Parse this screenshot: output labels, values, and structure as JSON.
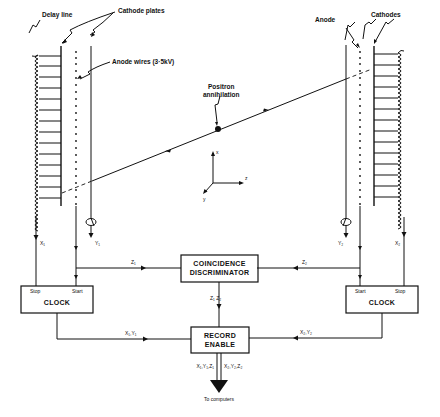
{
  "diagram": {
    "labels": {
      "delay_line": "Delay line",
      "cathode_plates": "Cathode plates",
      "anode_wires": "Anode wires (3·5kV)",
      "anode": "Anode",
      "cathodes": "Cathodes",
      "positron_line1": "Positron",
      "positron_line2": "annihilation",
      "axis_x": "x",
      "axis_y": "y",
      "axis_z": "z"
    },
    "signals": {
      "x1": "X₁",
      "y1": "Y₁",
      "x2": "X₂",
      "y2": "Y₂",
      "z1": "Z₁",
      "z2": "Z₂",
      "z1z2": "Z₁ Z₂",
      "x1y1": "X₁,Y₁",
      "x2y2": "X₂,Y₂",
      "x1y1z1": "X₁,Y₁,Z₁",
      "x2y2z2": "X₂,Y₂,Z₂"
    },
    "blocks": {
      "clock_left": {
        "title": "CLOCK",
        "port_left": "Stop",
        "port_right": "Start"
      },
      "clock_right": {
        "title": "CLOCK",
        "port_left": "Start",
        "port_right": "Stop"
      },
      "coincidence": {
        "line1": "COINCIDENCE",
        "line2": "DISCRIMINATOR"
      },
      "record": {
        "line1": "RECORD",
        "line2": "ENABLE"
      }
    },
    "output": "To computers"
  }
}
